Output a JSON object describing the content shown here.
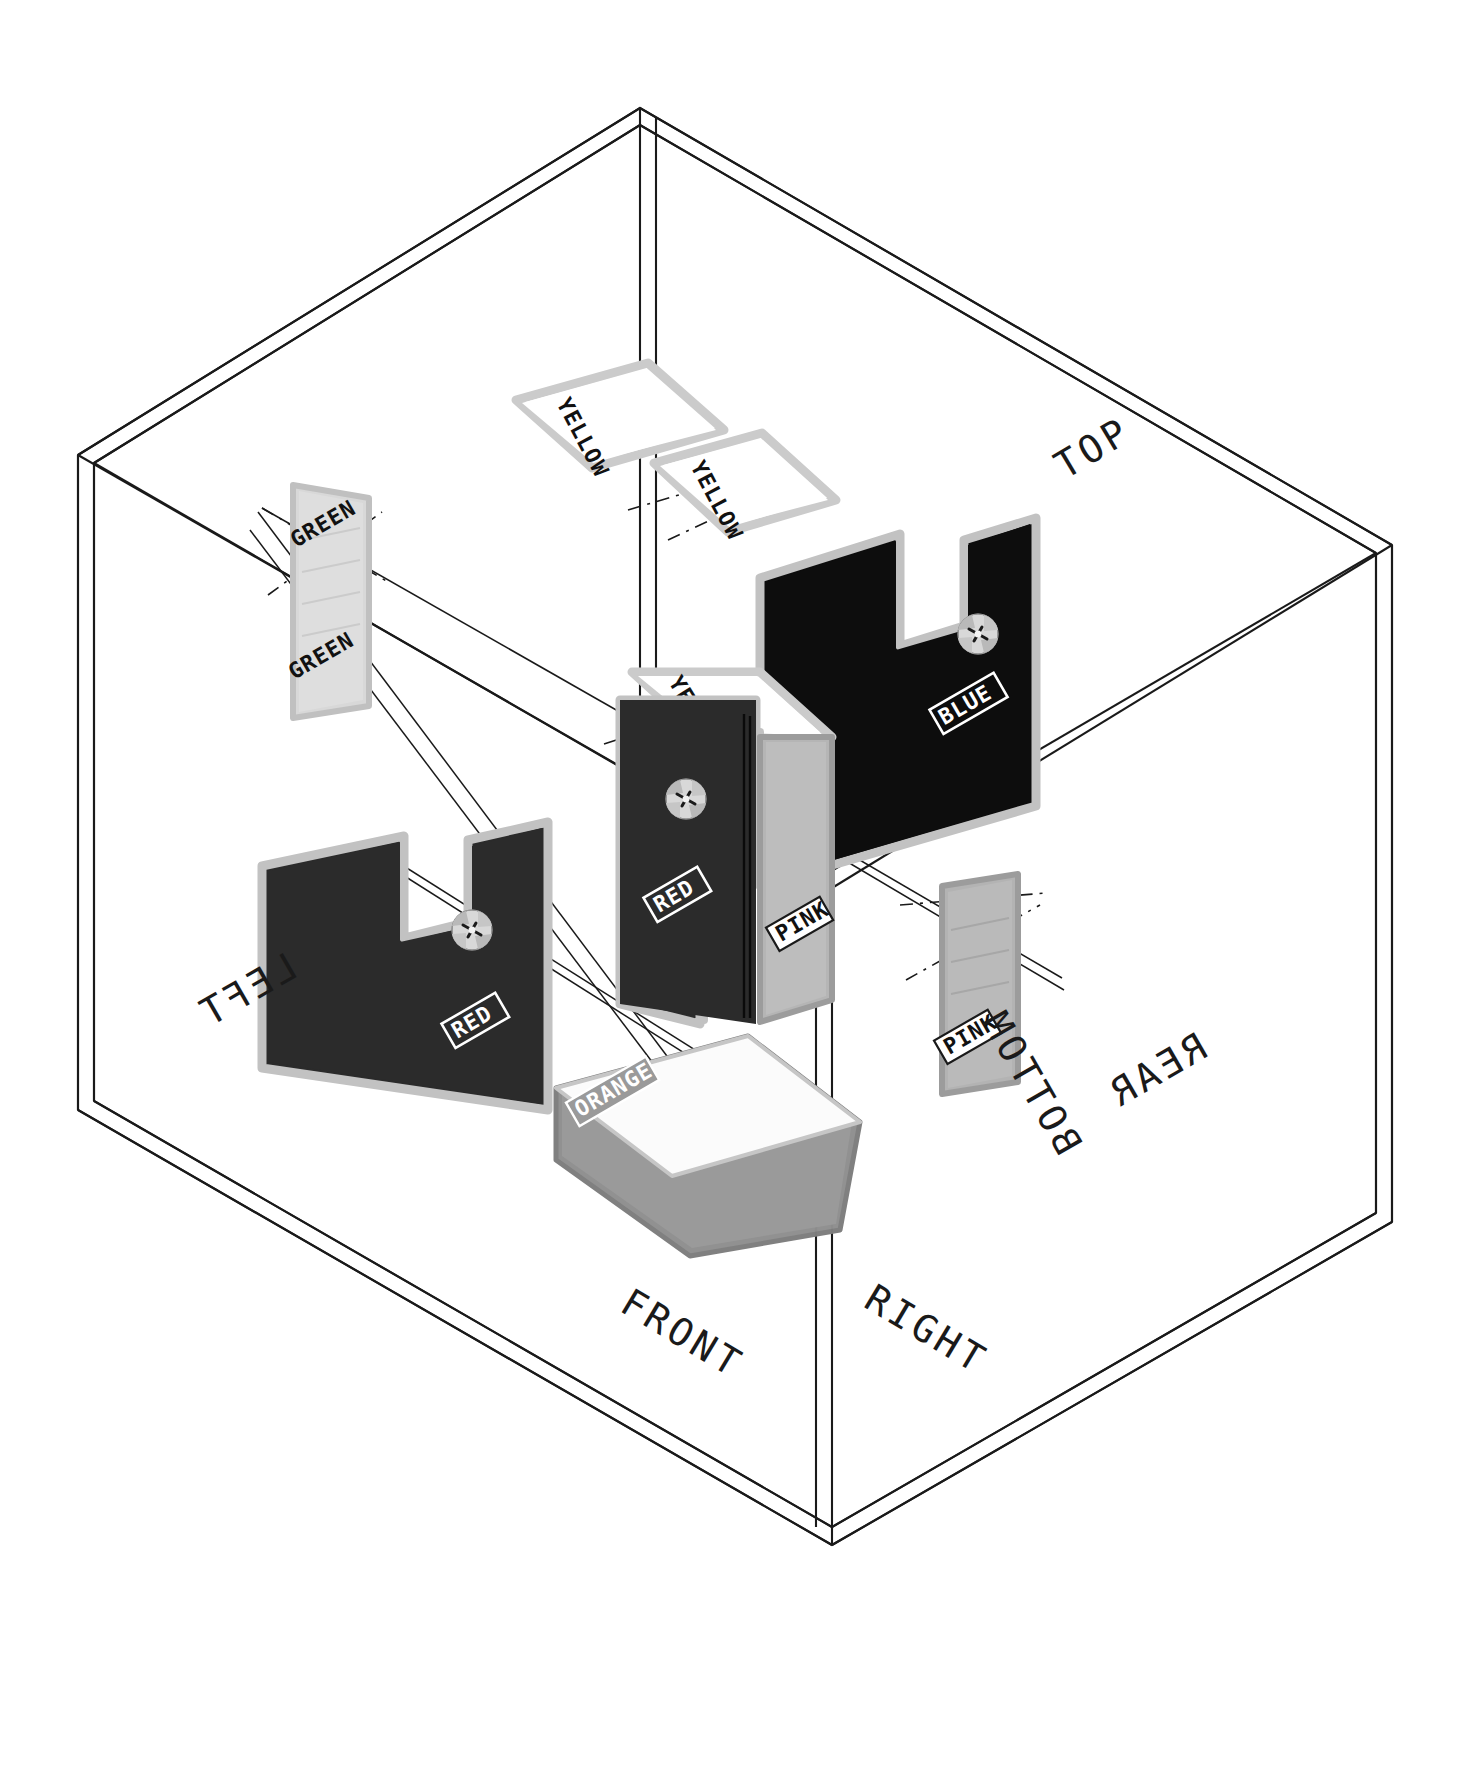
{
  "diagram": {
    "view_type": "isometric-exploded",
    "background_color": "#ffffff",
    "line_color": "#1a1a1a"
  },
  "bounding_box": {
    "name": "enclosure-wireframe",
    "face_labels": [
      {
        "id": "top",
        "text": "TOP",
        "x": 1065,
        "y": 480,
        "rotate": 0,
        "mirrored": false
      },
      {
        "id": "left",
        "text": "LEFT",
        "x": 300,
        "y": 975,
        "rotate": 0,
        "mirrored": true
      },
      {
        "id": "rear",
        "text": "REAR",
        "x": 1135,
        "y": 1055,
        "rotate": 0,
        "mirrored": true
      },
      {
        "id": "bottom",
        "text": "BOTTOM",
        "x": 1020,
        "y": 1175,
        "rotate": -60,
        "mirrored": true
      },
      {
        "id": "front",
        "text": "FRONT",
        "x": 620,
        "y": 1310,
        "rotate": 0,
        "mirrored": false
      },
      {
        "id": "right",
        "text": "RIGHT",
        "x": 815,
        "y": 1335,
        "rotate": 0,
        "mirrored": false
      }
    ]
  },
  "parts": [
    {
      "id": "green-plate",
      "label": "GREEN",
      "secondary_label": "GREEN",
      "color_name": "GREEN",
      "fill": "#d7d7d7",
      "edge": "#bfbfbf",
      "label_style": "dark-on-light",
      "position": "upper-left"
    },
    {
      "id": "yellow-plate-a",
      "label": "YELLOW",
      "color_name": "YELLOW",
      "fill": "#ffffff",
      "edge": "#c9c9c9",
      "label_style": "dark-on-light",
      "position": "top-rear"
    },
    {
      "id": "yellow-plate-b",
      "label": "YELLOW",
      "color_name": "YELLOW",
      "fill": "#ffffff",
      "edge": "#c9c9c9",
      "label_style": "dark-on-light",
      "position": "top-rear"
    },
    {
      "id": "blue-plate",
      "label": "BLUE",
      "color_name": "BLUE",
      "fill": "#0d0d0d",
      "edge": "#c2c2c2",
      "label_style": "light-on-dark",
      "position": "rear-right",
      "has_fastener": true
    },
    {
      "id": "red-plate-rear",
      "label": "RED",
      "color_name": "RED",
      "fill": "#2b2b2b",
      "edge": "#c2c2c2",
      "label_style": "light-on-dark",
      "position": "center",
      "has_fastener": true,
      "top_label": "YELLOW"
    },
    {
      "id": "red-plate-front",
      "label": "RED",
      "color_name": "RED",
      "fill": "#2b2b2b",
      "edge": "#c2c2c2",
      "label_style": "light-on-dark",
      "position": "center-front",
      "has_fastener": true,
      "top_label": "YELLOW"
    },
    {
      "id": "pink-block",
      "label": "PINK",
      "color_name": "PINK",
      "fill": "#b5b5b5",
      "edge": "#9a9a9a",
      "label_style": "dark-on-light",
      "position": "center-right"
    },
    {
      "id": "pink-plate-rear",
      "label": "PINK",
      "color_name": "PINK",
      "fill": "#b3b3b3",
      "edge": "#9a9a9a",
      "label_style": "dark-on-light",
      "position": "lower-right"
    },
    {
      "id": "orange-plate",
      "label": "ORANGE",
      "color_name": "ORANGE",
      "fill": "#8f8f8f",
      "edge": "#7a7a7a",
      "label_style": "dark-on-light",
      "position": "bottom-front"
    }
  ],
  "fasteners": [
    {
      "id": "fastener-blue",
      "type": "screw-head-icon",
      "cx": 978,
      "cy": 634
    },
    {
      "id": "fastener-red-a",
      "type": "screw-head-icon",
      "cx": 686,
      "cy": 799
    },
    {
      "id": "fastener-red-b",
      "type": "screw-head-icon",
      "cx": 472,
      "cy": 930
    }
  ],
  "legend": {
    "colors": {
      "GREEN": "#d7d7d7",
      "YELLOW": "#ffffff",
      "BLUE": "#0d0d0d",
      "RED": "#2b2b2b",
      "PINK": "#b5b5b5",
      "ORANGE": "#8f8f8f"
    }
  }
}
